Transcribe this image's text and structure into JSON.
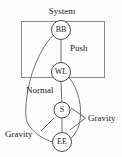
{
  "diagram": {
    "title_label": "System",
    "nodes": [
      {
        "id": "BB",
        "label": "BB",
        "cx": 61,
        "cy": 30,
        "r": 9.5
      },
      {
        "id": "WL",
        "label": "WL",
        "cx": 61,
        "cy": 72,
        "r": 9.5
      },
      {
        "id": "S",
        "label": "S",
        "cx": 62,
        "cy": 110,
        "r": 8
      },
      {
        "id": "EE",
        "label": "EE",
        "cx": 62,
        "cy": 142,
        "r": 9.5
      }
    ],
    "edge_labels": {
      "push": "Push",
      "normal": "Normal",
      "gravity_right": "Gravity",
      "gravity_left": "Gravity"
    },
    "boundary": {
      "label": "System",
      "x": 21,
      "y": 21,
      "width": 83,
      "height": 56
    },
    "colors": {
      "stroke": "#6a6a6a",
      "node_stroke": "#4a4a4a",
      "text": "#1a1a1a",
      "background": "#fdfdfd"
    }
  }
}
